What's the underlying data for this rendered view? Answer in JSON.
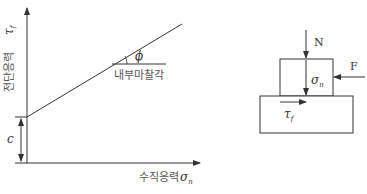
{
  "left_diagram": {
    "title": "Mohr-Coulomb failure envelope",
    "y_axis_label": "전단응력",
    "y_axis_symbol": "τ",
    "y_axis_symbol_sub": "f",
    "x_axis_label": "수직응력",
    "x_axis_symbol": "σ",
    "x_axis_symbol_sub": "n",
    "angle_symbol": "ϕ",
    "angle_label": "내부마찰각",
    "intercept_label": "c"
  },
  "right_diagram": {
    "title": "Direct shear box",
    "normal_force_label": "N",
    "normal_stress_symbol": "σ",
    "normal_stress_sub": "n",
    "shear_force_label": "F",
    "shear_stress_symbol": "τ",
    "shear_stress_sub": "f"
  },
  "colors": {
    "line": "#333333",
    "text": "#555555"
  }
}
